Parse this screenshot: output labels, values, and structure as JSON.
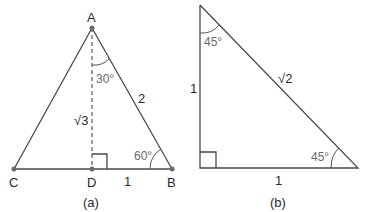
{
  "figure_a": {
    "caption": "(a)",
    "vertices": {
      "A": "A",
      "B": "B",
      "C": "C",
      "D": "D"
    },
    "angle_top": "30°",
    "angle_bottom_right": "60°",
    "side_hypotenuse": "2",
    "side_base": "1",
    "side_height": "√3"
  },
  "figure_b": {
    "caption": "(b)",
    "angle_top": "45°",
    "angle_bottom_right": "45°",
    "side_vertical": "1",
    "side_horizontal": "1",
    "side_hypotenuse": "√2"
  }
}
